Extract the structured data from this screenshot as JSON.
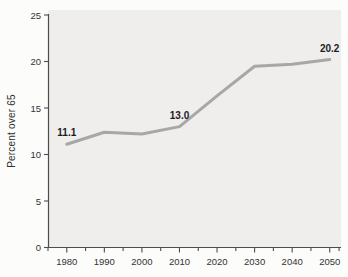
{
  "chart_data": {
    "type": "line",
    "ylabel": "Percent over 65",
    "xlabel": "",
    "x": [
      1980,
      1990,
      2000,
      2010,
      2020,
      2030,
      2040,
      2050
    ],
    "values": [
      11.1,
      12.4,
      12.2,
      13.0,
      16.3,
      19.5,
      19.7,
      20.2
    ],
    "point_labels": [
      "11.1",
      "",
      "",
      "13.0",
      "",
      "",
      "",
      "20.2"
    ],
    "x_ticks": [
      1980,
      1990,
      2000,
      2010,
      2020,
      2030,
      2040,
      2050
    ],
    "x_minor_ticks": [
      1975,
      1985,
      1995,
      2005,
      2015,
      2025,
      2035,
      2045,
      2052.5
    ],
    "y_ticks": [
      0,
      5,
      10,
      15,
      20,
      25
    ],
    "xlim": [
      1975,
      2053
    ],
    "ylim": [
      0,
      25
    ],
    "grid": false,
    "legend": null,
    "colors": {
      "line": "#a8a7a5",
      "plot_bg": "#efeeec",
      "axis": "#4d4d4d",
      "tick_text": "#333333",
      "point_label_text": "#1c1c1c"
    }
  }
}
